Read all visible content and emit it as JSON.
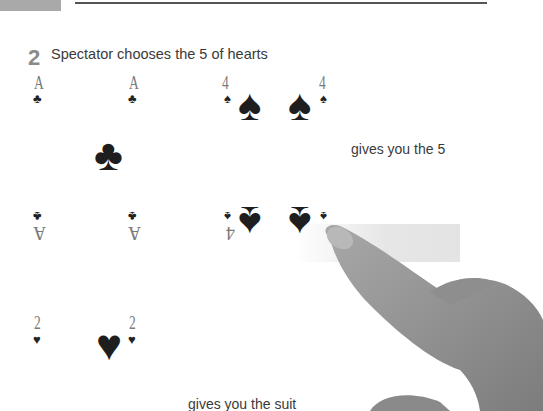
{
  "header": {
    "tab_color": "#a9a9a9",
    "rule_color": "#555555"
  },
  "step": {
    "number": "2",
    "text": "Spectator chooses the 5 of hearts"
  },
  "cards": {
    "ace_of_clubs": {
      "rank": "A",
      "suit_small": "♣",
      "suit_big": "♣",
      "rank_flipped": "A",
      "suit_small_flipped": "♣"
    },
    "four_of_spades": {
      "rank": "4",
      "suit_small": "♠",
      "suit_big": "♠",
      "rank_flipped": "4",
      "suit_small_flipped": "♠"
    },
    "two_of_hearts": {
      "rank": "2",
      "suit_small": "♥",
      "suit_big": "♥"
    }
  },
  "captions": {
    "value": "gives you the 5",
    "suit": "gives you the suit"
  },
  "image": {
    "hand": "pointing-hand"
  }
}
